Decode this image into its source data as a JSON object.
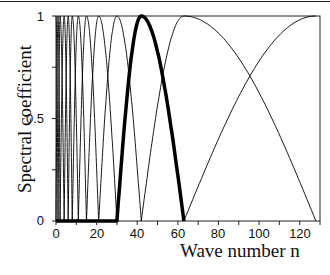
{
  "chart_data": {
    "type": "line",
    "title": "",
    "xlabel": "Wave number n",
    "ylabel": "Spectral coefficient",
    "xlim": [
      0,
      130
    ],
    "ylim": [
      0,
      1
    ],
    "x_ticks": [
      0,
      20,
      40,
      60,
      80,
      100,
      120
    ],
    "x_tick_labels": [
      "0",
      "20",
      "40",
      "60",
      "80",
      "100",
      "120"
    ],
    "x_minor_ticks": [
      10,
      30,
      50,
      70,
      90,
      110,
      130
    ],
    "y_ticks": [
      0,
      0.25,
      0.5,
      0.75,
      1
    ],
    "y_tick_labels": [
      "0",
      "",
      "0.5",
      "",
      "1"
    ],
    "grid": false,
    "legend": null,
    "series": [
      {
        "name": "window peak 0",
        "peak": 0,
        "support": [
          0,
          1
        ],
        "style": "thin"
      },
      {
        "name": "window peak 1",
        "peak": 1,
        "support": [
          0,
          2
        ],
        "style": "thin"
      },
      {
        "name": "window peak 2",
        "peak": 2,
        "support": [
          1,
          4
        ],
        "style": "thin"
      },
      {
        "name": "window peak 4",
        "peak": 4,
        "support": [
          2,
          6
        ],
        "style": "thin"
      },
      {
        "name": "window peak 6",
        "peak": 6,
        "support": [
          4,
          8
        ],
        "style": "thin"
      },
      {
        "name": "window peak 8",
        "peak": 8,
        "support": [
          6,
          11
        ],
        "style": "thin"
      },
      {
        "name": "window peak 11",
        "peak": 11,
        "support": [
          8,
          15
        ],
        "style": "thin"
      },
      {
        "name": "window peak 15",
        "peak": 15,
        "support": [
          11,
          21
        ],
        "style": "thin"
      },
      {
        "name": "window peak 21",
        "peak": 21,
        "support": [
          15,
          30
        ],
        "style": "thin"
      },
      {
        "name": "window peak 30",
        "peak": 30,
        "support": [
          21,
          42
        ],
        "style": "thin"
      },
      {
        "name": "window peak 42 (highlighted)",
        "peak": 42,
        "support": [
          30,
          63
        ],
        "style": "bold"
      },
      {
        "name": "window peak 63",
        "peak": 63,
        "support": [
          42,
          128
        ],
        "style": "thin"
      },
      {
        "name": "window peak 128",
        "peak": 128,
        "support": [
          63,
          128
        ],
        "style": "thin"
      }
    ],
    "annotations": [
      "bold curve: window with peak at n=42, support 30-63",
      "thin curves cross near n~99 at value ~0.7"
    ]
  },
  "labels": {
    "ylabel": "Spectral coefficient",
    "xlabel": "Wave number n",
    "xticks": [
      "0",
      "20",
      "40",
      "60",
      "80",
      "100",
      "120"
    ],
    "yticks": [
      "0",
      "0.5",
      "1"
    ]
  }
}
